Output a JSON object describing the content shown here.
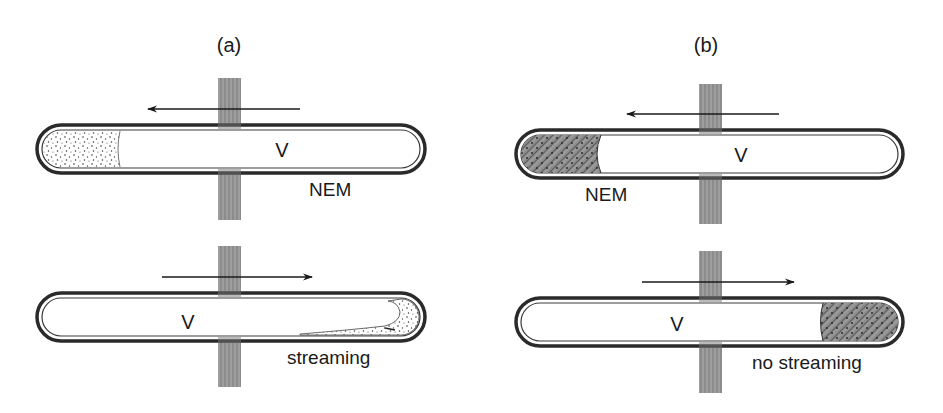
{
  "figure": {
    "panels": [
      {
        "id": "a",
        "label": "(a)",
        "electrode": "vertical striped electrode crossing both capillaries",
        "rows": [
          {
            "vessel_label": "V",
            "flow_direction": "left",
            "fill_end": "left",
            "fill_pattern": "stippled",
            "caption": "NEM",
            "fill_fraction": 0.2
          },
          {
            "vessel_label": "V",
            "flow_direction": "right",
            "fill_end": "right",
            "fill_pattern": "stippled-streaming",
            "caption": "streaming",
            "fill_fraction": 0.08
          }
        ]
      },
      {
        "id": "b",
        "label": "(b)",
        "electrode": "vertical striped electrode crossing both capillaries",
        "rows": [
          {
            "vessel_label": "V",
            "flow_direction": "left",
            "fill_end": "left",
            "fill_pattern": "hatched-stippled",
            "caption": "NEM",
            "fill_fraction": 0.2
          },
          {
            "vessel_label": "V",
            "flow_direction": "right",
            "fill_end": "right",
            "fill_pattern": "hatched-stippled",
            "caption": "no streaming",
            "fill_fraction": 0.2
          }
        ]
      }
    ],
    "colors": {
      "ink": "#1a1a1a",
      "wall": "#2a2a2a",
      "electrode": "#8a8a8a",
      "hatch_fill": "#7a7a7a",
      "background": "#ffffff"
    }
  }
}
